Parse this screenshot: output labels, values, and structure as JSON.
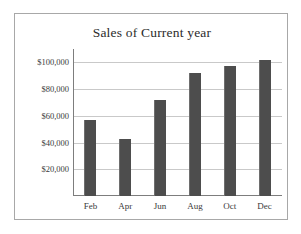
{
  "chart_data": {
    "type": "bar",
    "title": "Sales of Current year",
    "xlabel": "",
    "ylabel": "",
    "categories": [
      "Feb",
      "Apr",
      "Jun",
      "Aug",
      "Oct",
      "Dec"
    ],
    "values": [
      57000,
      43000,
      72000,
      92000,
      97000,
      102000
    ],
    "ylim": [
      0,
      110000
    ],
    "ytick_values": [
      20000,
      40000,
      60000,
      80000,
      100000
    ],
    "ytick_labels": [
      "$20,000",
      "$40,000",
      "$60,000",
      "$80,000",
      "$100,000"
    ],
    "grid": true,
    "legend": false,
    "bar_color": "#4d4d4d",
    "gridline_color": "#c9c9c9",
    "axis_color": "#7d7d7d",
    "border_color": "#a8a8a8",
    "background_color": "#ffffff"
  }
}
